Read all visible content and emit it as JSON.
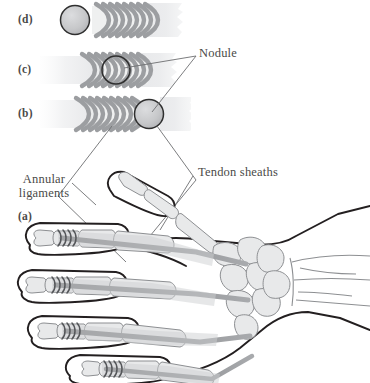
{
  "figure": {
    "panels": [
      {
        "id": "d",
        "label": "(d)",
        "description": "nodule free distal to the annular ligaments"
      },
      {
        "id": "c",
        "label": "(c)",
        "description": "nodule trapped within the annular ligaments"
      },
      {
        "id": "b",
        "label": "(b)",
        "description": "nodule proximal to the annular ligaments"
      },
      {
        "id": "a",
        "label": "(a)",
        "description": "dorsal view of the hand skeleton with flexor tendon sheaths"
      }
    ],
    "annotations": [
      {
        "id": "nodule",
        "text": "Nodule"
      },
      {
        "id": "tendon-sheaths",
        "text": "Tendon sheaths"
      },
      {
        "id": "annular-ligaments",
        "line1": "Annular",
        "line2": "ligaments"
      }
    ],
    "caption_fragment": "",
    "colors": {
      "outline": "#231f20",
      "bone_fill": "#e8e9ea",
      "bone_stroke": "#8d8f92",
      "tendon": "#8f9194",
      "sheath_light": "#e3e4e6",
      "nodule_fill": "#c9cacb",
      "nodule_stroke": "#2f2f2f",
      "arc_fill": "#b9babc",
      "leader": "#6d6e70",
      "text": "#4a4a48",
      "background": "#ffffff"
    }
  }
}
